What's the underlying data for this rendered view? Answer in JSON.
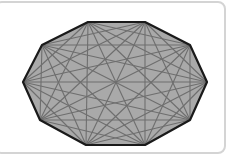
{
  "figure": {
    "shape": "decagon",
    "vertex_count": 10,
    "vertices": [
      [
        23,
        82
      ],
      [
        42,
        45
      ],
      [
        88,
        22
      ],
      [
        145,
        22
      ],
      [
        190,
        45
      ],
      [
        207,
        82
      ],
      [
        190,
        120
      ],
      [
        145,
        145
      ],
      [
        86,
        145
      ],
      [
        40,
        120
      ]
    ],
    "colors": {
      "fill": "#a9a9a9",
      "outline": "#1a1a1a",
      "diagonal": "#6e6e6e",
      "frame_border": "#d4d4d4",
      "background": "#ffffff"
    },
    "outline_width": 2.2,
    "diagonal_width": 1.1
  }
}
